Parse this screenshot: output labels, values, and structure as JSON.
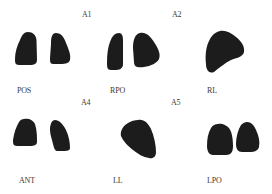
{
  "figure": {
    "panel_labels": {
      "a1": "A1",
      "a2": "A2",
      "a4": "A4",
      "a5": "A5"
    },
    "views": [
      {
        "id": "pos",
        "label": "POS"
      },
      {
        "id": "rpo",
        "label": "RPO"
      },
      {
        "id": "rl",
        "label": "RL"
      },
      {
        "id": "ant",
        "label": "ANT"
      },
      {
        "id": "ll",
        "label": "LL"
      },
      {
        "id": "lpo",
        "label": "LPO"
      }
    ],
    "colors": {
      "background": "#ffffff",
      "uptake": "#1c1c1c",
      "text": "#3a3a3a"
    }
  }
}
